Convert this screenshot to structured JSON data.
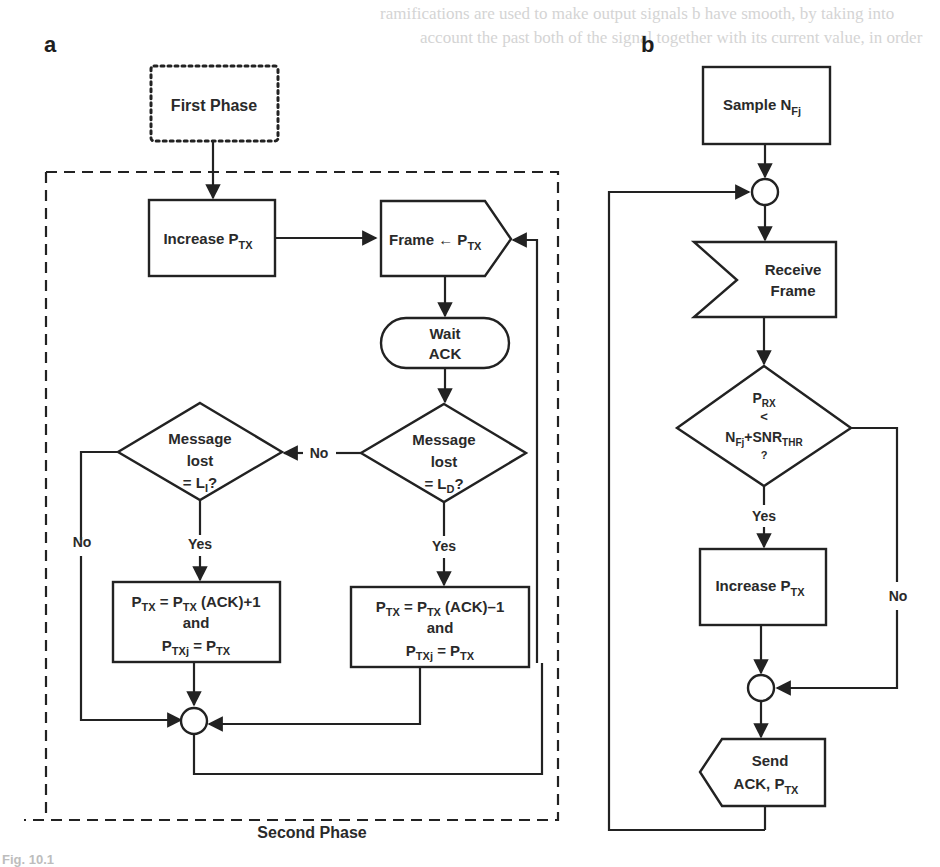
{
  "figure": {
    "panel_a_label": "a",
    "panel_b_label": "b",
    "line_color": "#222222",
    "background": "#ffffff"
  },
  "panel_a": {
    "first_phase": "First Phase",
    "second_phase_caption": "Second Phase",
    "increase_ptx": {
      "text": "Increase P",
      "sub": "TX"
    },
    "frame_ptx": {
      "text": "Frame ← P",
      "sub": "TX"
    },
    "wait_ack": {
      "line1": "Wait",
      "line2": "ACK"
    },
    "decision_li": {
      "line1": "Message",
      "line2": "lost",
      "line3_prefix": "= L",
      "line3_sub": "I",
      "line3_suffix": "?"
    },
    "decision_ld": {
      "line1": "Message",
      "line2": "lost",
      "line3_prefix": "= L",
      "line3_sub": "D",
      "line3_suffix": "?"
    },
    "edge_no_ld_to_li": "No",
    "edge_no_li": "No",
    "edge_yes_li": "Yes",
    "edge_yes_ld": "Yes",
    "update_increase": {
      "l1_a": "P",
      "l1_a_sub": "TX",
      "l1_b": " = P",
      "l1_b_sub": "TX",
      "l1_c": " (ACK)+1",
      "l2": "and",
      "l3_a": "P",
      "l3_a_sub": "TXj",
      "l3_b": " = P",
      "l3_b_sub": "TX"
    },
    "update_decrease": {
      "l1_a": "P",
      "l1_a_sub": "TX",
      "l1_b": " = P",
      "l1_b_sub": "TX",
      "l1_c": " (ACK)–1",
      "l2": "and",
      "l3_a": "P",
      "l3_a_sub": "TXj",
      "l3_b": " = P",
      "l3_b_sub": "TX"
    }
  },
  "panel_b": {
    "sample": {
      "text": "Sample N",
      "sub": "Fj"
    },
    "receive_frame": {
      "line1": "Receive",
      "line2": "Frame"
    },
    "decision": {
      "l1": "P",
      "l1_sub": "RX",
      "l2": "<",
      "l3": "N",
      "l3_sub": "Fj",
      "l3_mid": "+SNR",
      "l3_sub2": "THR",
      "l4": "?"
    },
    "edge_yes": "Yes",
    "edge_no": "No",
    "increase_ptx": {
      "text": "Increase P",
      "sub": "TX"
    },
    "send_ack": {
      "line1": "Send",
      "line2": "ACK, P",
      "line2_sub": "TX"
    }
  },
  "caption_stub": "Fig. 10.1"
}
